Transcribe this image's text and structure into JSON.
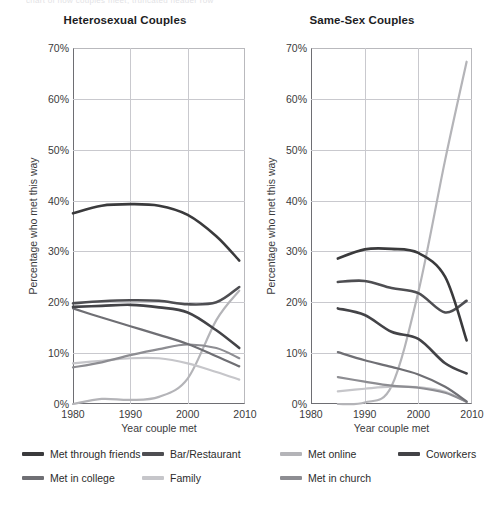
{
  "page": {
    "cut_text": "chart of how couples meet, truncated header row"
  },
  "axes": {
    "ylabel": "Percentage who met this way",
    "xlabel": "Year couple met",
    "yticks": [
      "0%",
      "10%",
      "20%",
      "30%",
      "40%",
      "50%",
      "60%",
      "70%"
    ],
    "xticks": [
      "1980",
      "1990",
      "2000",
      "2010"
    ],
    "ylim": [
      0,
      70
    ],
    "xlim": [
      1980,
      2010
    ]
  },
  "colors": {
    "met_through_friends": "#3a3a3c",
    "bar_restaurant": "#4e4e52",
    "met_online": "#b4b4b8",
    "coworkers": "#434347",
    "met_in_college": "#6f6f74",
    "family": "#c6c6ca",
    "met_in_church": "#8d8d92",
    "grid": "#c9c9ce",
    "axis": "#6e6e73",
    "text": "#2b2b2b"
  },
  "legend": {
    "position": "bottom",
    "rows": [
      [
        {
          "label": "Met through friends",
          "key": "met_through_friends",
          "color": "#3a3a3c"
        },
        {
          "label": "Bar/Restaurant",
          "key": "bar_restaurant",
          "color": "#4e4e52"
        },
        {
          "label": "Met online",
          "key": "met_online",
          "color": "#b4b4b8"
        },
        {
          "label": "Coworkers",
          "key": "coworkers",
          "color": "#434347"
        }
      ],
      [
        {
          "label": "Met in college",
          "key": "met_in_college",
          "color": "#6f6f74"
        },
        {
          "label": "Family",
          "key": "family",
          "color": "#c6c6ca"
        },
        {
          "label": "Met in church",
          "key": "met_in_church",
          "color": "#8d8d92"
        }
      ]
    ]
  },
  "chart_data": [
    {
      "type": "line",
      "title": "Heterosexual Couples",
      "xlabel": "Year couple met",
      "ylabel": "Percentage who met this way",
      "xlim": [
        1980,
        2010
      ],
      "ylim": [
        0,
        70
      ],
      "grid": true,
      "x": [
        1980,
        1985,
        1990,
        1995,
        2000,
        2005,
        2009
      ],
      "series": [
        {
          "name": "Met through friends",
          "color": "#3a3a3c",
          "values": [
            37.5,
            39.0,
            39.3,
            39.0,
            37.2,
            33.0,
            28.2
          ]
        },
        {
          "name": "Bar/Restaurant",
          "color": "#4e4e52",
          "values": [
            19.8,
            20.2,
            20.4,
            20.3,
            19.6,
            20.0,
            23.0
          ]
        },
        {
          "name": "Met online",
          "color": "#b4b4b8",
          "values": [
            0.0,
            1.0,
            0.8,
            1.4,
            5.0,
            16.5,
            22.3
          ]
        },
        {
          "name": "Coworkers",
          "color": "#434347",
          "values": [
            19.1,
            19.3,
            19.5,
            19.0,
            18.0,
            14.5,
            11.0
          ]
        },
        {
          "name": "Met in college",
          "color": "#6f6f74",
          "values": [
            18.8,
            17.0,
            15.3,
            13.6,
            11.8,
            9.4,
            7.4
          ]
        },
        {
          "name": "Family",
          "color": "#c6c6ca",
          "values": [
            8.0,
            8.5,
            9.0,
            9.0,
            8.0,
            6.3,
            4.8
          ]
        },
        {
          "name": "Met in church",
          "color": "#8d8d92",
          "values": [
            7.2,
            8.2,
            9.6,
            10.8,
            11.7,
            11.0,
            9.0
          ]
        }
      ]
    },
    {
      "type": "line",
      "title": "Same-Sex Couples",
      "xlabel": "Year couple met",
      "ylabel": "Percentage who met this way",
      "xlim": [
        1980,
        2010
      ],
      "ylim": [
        0,
        70
      ],
      "grid": true,
      "x": [
        1985,
        1990,
        1995,
        2000,
        2005,
        2009
      ],
      "series": [
        {
          "name": "Met through friends",
          "color": "#3a3a3c",
          "values": [
            28.6,
            30.4,
            30.5,
            29.7,
            25.0,
            12.5
          ]
        },
        {
          "name": "Bar/Restaurant",
          "color": "#4e4e52",
          "values": [
            24.0,
            24.2,
            22.8,
            21.8,
            18.0,
            20.3
          ]
        },
        {
          "name": "Met online",
          "color": "#b4b4b8",
          "values": [
            0.0,
            0.3,
            3.5,
            22.0,
            48.0,
            67.3
          ]
        },
        {
          "name": "Coworkers",
          "color": "#434347",
          "values": [
            18.8,
            17.5,
            14.2,
            12.8,
            8.0,
            6.0
          ]
        },
        {
          "name": "Met in college",
          "color": "#6f6f74",
          "values": [
            10.2,
            8.6,
            7.3,
            5.8,
            3.4,
            0.5
          ]
        },
        {
          "name": "Family",
          "color": "#c6c6ca",
          "values": [
            2.5,
            3.0,
            3.4,
            3.3,
            2.4,
            0.4
          ]
        },
        {
          "name": "Met in church",
          "color": "#8d8d92",
          "values": [
            5.3,
            4.4,
            3.6,
            3.2,
            2.2,
            0.4
          ]
        }
      ]
    }
  ]
}
